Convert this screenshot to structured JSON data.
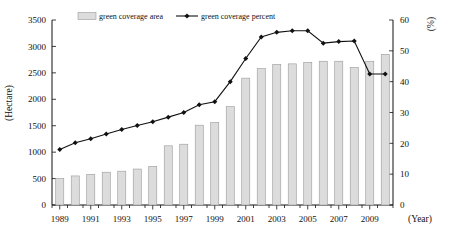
{
  "chart_data": {
    "type": "bar",
    "title": "",
    "subtitle": "",
    "xlabel": "(Year)",
    "ylabel": "(Hectare)",
    "y2label": "(%)",
    "grid": false,
    "legend_position": "top",
    "x": [
      1989,
      1990,
      1991,
      1992,
      1993,
      1994,
      1995,
      1996,
      1997,
      1998,
      1999,
      2000,
      2001,
      2002,
      2003,
      2004,
      2005,
      2006,
      2007,
      2008,
      2009,
      2010
    ],
    "categories": [
      "1989",
      "1990",
      "1991",
      "1992",
      "1993",
      "1994",
      "1995",
      "1996",
      "1997",
      "1998",
      "1999",
      "2000",
      "2001",
      "2002",
      "2003",
      "2004",
      "2005",
      "2006",
      "2007",
      "2008",
      "2009",
      "2010"
    ],
    "xtick_labels": [
      "1989",
      "1991",
      "1993",
      "1995",
      "1997",
      "1999",
      "2001",
      "2003",
      "2005",
      "2007",
      "2009"
    ],
    "ylim": [
      0,
      3500
    ],
    "ytick_labels": [
      "0",
      "500",
      "1000",
      "1500",
      "2000",
      "2500",
      "3000",
      "3500"
    ],
    "yticks": [
      0,
      500,
      1000,
      1500,
      2000,
      2500,
      3000,
      3500
    ],
    "y2lim": [
      0,
      60
    ],
    "y2tick_labels": [
      "0",
      "10",
      "20",
      "30",
      "40",
      "50",
      "60"
    ],
    "y2ticks": [
      0,
      10,
      20,
      30,
      40,
      50,
      60
    ],
    "series": [
      {
        "name": "green coverage area",
        "type": "bar",
        "axis": "left",
        "unit": "Hectare",
        "color": "#dcdcdc",
        "values": [
          500,
          550,
          580,
          620,
          640,
          680,
          730,
          1120,
          1150,
          1510,
          1560,
          1860,
          2400,
          2580,
          2660,
          2670,
          2700,
          2720,
          2720,
          2600,
          2720,
          2850
        ]
      },
      {
        "name": "green coverage percent",
        "type": "line",
        "axis": "right",
        "unit": "%",
        "color": "#111111",
        "marker": "diamond",
        "values": [
          18.0,
          20.2,
          21.5,
          23.0,
          24.5,
          25.8,
          27.0,
          28.5,
          30.0,
          32.5,
          33.5,
          40.0,
          47.5,
          54.5,
          56.0,
          56.5,
          56.5,
          52.5,
          53.0,
          53.2,
          42.5,
          42.5
        ]
      }
    ],
    "legend": [
      {
        "label": "green coverage area",
        "marker": "swatch",
        "color": "#dcdcdc"
      },
      {
        "label": "green coverage percent",
        "marker": "line-diamond",
        "color": "#111111"
      }
    ]
  }
}
